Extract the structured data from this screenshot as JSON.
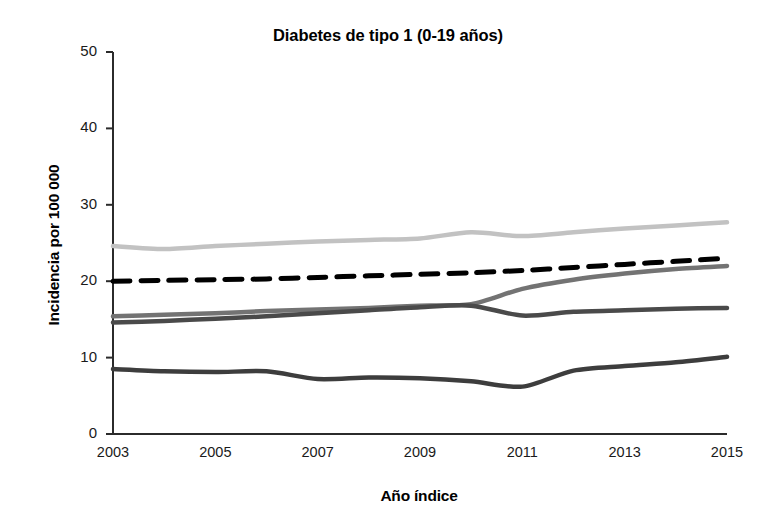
{
  "chart_data": {
    "type": "line",
    "title": "Diabetes de tipo 1 (0-19 años)",
    "xlabel": "Año índice",
    "ylabel": "Incidencia por 100 000",
    "x": [
      2003,
      2004,
      2005,
      2006,
      2007,
      2008,
      2009,
      2010,
      2011,
      2012,
      2013,
      2014,
      2015
    ],
    "xlim": [
      2003,
      2015
    ],
    "ylim": [
      0,
      50
    ],
    "yticks": [
      0,
      10,
      20,
      30,
      40,
      50
    ],
    "ytick_labels": [
      "0",
      "10",
      "20",
      "30",
      "40",
      "50"
    ],
    "xticks": [
      2003,
      2005,
      2007,
      2009,
      2011,
      2013,
      2015
    ],
    "xtick_labels": [
      "2003",
      "2005",
      "2007",
      "2009",
      "2011",
      "2013",
      "2015"
    ],
    "grid": false,
    "legend": "none",
    "series": [
      {
        "name": "serie-gris-claro",
        "color": "#c2c2c2",
        "style": "solid",
        "width": 4.5,
        "values": [
          24.6,
          24.2,
          24.6,
          24.9,
          25.2,
          25.4,
          25.6,
          26.4,
          25.9,
          26.4,
          26.9,
          27.3,
          27.7
        ]
      },
      {
        "name": "serie-negra-discontinua",
        "color": "#000000",
        "style": "dashed",
        "width": 5.0,
        "values": [
          20.0,
          20.1,
          20.2,
          20.3,
          20.5,
          20.7,
          20.9,
          21.1,
          21.4,
          21.8,
          22.2,
          22.6,
          23.0
        ]
      },
      {
        "name": "serie-gris-medio",
        "color": "#737373",
        "style": "solid",
        "width": 4.5,
        "values": [
          15.4,
          15.6,
          15.8,
          16.1,
          16.3,
          16.5,
          16.8,
          17.0,
          19.0,
          20.2,
          21.0,
          21.6,
          22.0
        ]
      },
      {
        "name": "serie-gris-oscuro",
        "color": "#4a4a4a",
        "style": "solid",
        "width": 4.5,
        "values": [
          14.6,
          14.8,
          15.1,
          15.4,
          15.8,
          16.2,
          16.6,
          16.8,
          15.5,
          16.0,
          16.2,
          16.4,
          16.5
        ]
      },
      {
        "name": "serie-oscura-inferior",
        "color": "#3d3d3d",
        "style": "solid",
        "width": 4.5,
        "values": [
          8.5,
          8.2,
          8.1,
          8.2,
          7.2,
          7.4,
          7.3,
          6.9,
          6.2,
          8.3,
          8.9,
          9.4,
          10.1
        ]
      }
    ]
  },
  "axes": {
    "axis_color": "#2b2b2b"
  }
}
